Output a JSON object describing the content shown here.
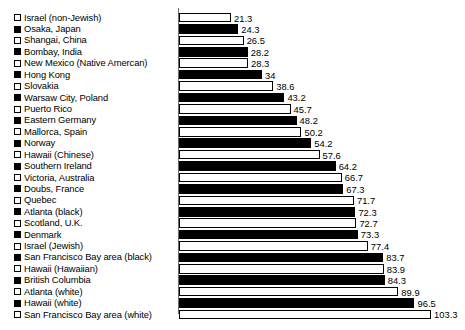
{
  "chart_data": {
    "type": "bar",
    "orientation": "horizontal",
    "title": "",
    "subtitle": "",
    "xlabel": "",
    "ylabel": "",
    "grid": false,
    "legend_position": "inline-left",
    "xlim": [
      0,
      103.3
    ],
    "axis_ticks": [],
    "categories": [
      "Israel (non-Jewish)",
      "Osaka, Japan",
      "Shangai, China",
      "Bombay, India",
      "New Mexico (Native Amercan)",
      "Hong Kong",
      "Slovakia",
      "Warsaw City, Poland",
      "Puerto Rico",
      "Eastern Germany",
      "Mallorca, Spain",
      "Norway",
      "Hawaii (Chinese)",
      "Southern Ireland",
      "Victoria, Australia",
      "Doubs, France",
      "Quebec",
      "Atlanta (black)",
      "Scotland, U.K.",
      "Denmark",
      "Israel (Jewish)",
      "San Francisco Bay area (black)",
      "Hawaii (Hawaiian)",
      "British Columbia",
      "Atlanta (white)",
      "Hawaii (white)",
      "San Francisco Bay area (white)"
    ],
    "values": [
      21.3,
      24.3,
      26.5,
      28.2,
      28.3,
      34,
      38.6,
      43.2,
      45.7,
      48.2,
      50.2,
      54.2,
      57.6,
      64.2,
      66.7,
      67.3,
      71.7,
      72.3,
      72.7,
      73.3,
      77.4,
      83.7,
      83.9,
      84.3,
      89.9,
      96.5,
      103.3
    ],
    "value_labels": [
      "21.3",
      "24.3",
      "26.5",
      "28.2",
      "28.3",
      "34",
      "38.6",
      "43.2",
      "45.7",
      "48.2",
      "50.2",
      "54.2",
      "57.6",
      "64.2",
      "66.7",
      "67.3",
      "71.7",
      "72.3",
      "72.7",
      "73.3",
      "77.4",
      "83.7",
      "83.9",
      "84.3",
      "89.9",
      "96.5",
      "103.3"
    ],
    "bar_styles": [
      "hollow",
      "filled",
      "hollow",
      "filled",
      "hollow",
      "filled",
      "hollow",
      "filled",
      "hollow",
      "filled",
      "hollow",
      "filled",
      "hollow",
      "filled",
      "hollow",
      "filled",
      "hollow",
      "filled",
      "hollow",
      "filled",
      "hollow",
      "filled",
      "hollow",
      "filled",
      "hollow",
      "filled",
      "hollow"
    ],
    "colors": {
      "filled": "#000000",
      "hollow": "#ffffff",
      "outline": "#000000",
      "axis": "#6d6d6d",
      "text": "#000000",
      "background": "#ffffff"
    }
  }
}
